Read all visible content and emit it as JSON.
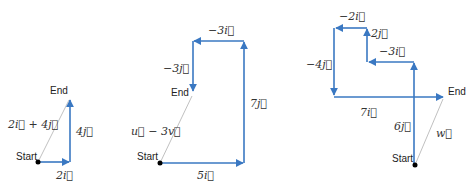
{
  "colors": {
    "vector": "#3a78c2",
    "resultant": "#b0b0b0",
    "point": "#000000",
    "text": "#222222"
  },
  "diagrams": [
    {
      "id": "diagram-1",
      "start_label": "Start",
      "end_label": "End",
      "resultant_label": "2i⃗ + 4j⃗",
      "steps": [
        {
          "label": "2i⃗",
          "dx": 2,
          "dy": 0
        },
        {
          "label": "4j⃗",
          "dx": 0,
          "dy": 4
        }
      ]
    },
    {
      "id": "diagram-2",
      "start_label": "Start",
      "end_label": "End",
      "resultant_label": "u⃗ − 3v⃗",
      "steps": [
        {
          "label": "5i⃗",
          "dx": 5,
          "dy": 0
        },
        {
          "label": "7j⃗",
          "dx": 0,
          "dy": 7
        },
        {
          "label": "−3i⃗",
          "dx": -3,
          "dy": 0
        },
        {
          "label": "−3j⃗",
          "dx": 0,
          "dy": -3
        }
      ]
    },
    {
      "id": "diagram-3",
      "start_label": "Start",
      "end_label": "End",
      "resultant_label": "w⃗",
      "steps": [
        {
          "label": "6j⃗",
          "dx": 0,
          "dy": 6
        },
        {
          "label": "−3i⃗",
          "dx": -3,
          "dy": 0
        },
        {
          "label": "2j⃗",
          "dx": 0,
          "dy": 2
        },
        {
          "label": "−2i⃗",
          "dx": -2,
          "dy": 0
        },
        {
          "label": "−4j⃗",
          "dx": 0,
          "dy": -4
        },
        {
          "label": "7i⃗",
          "dx": 7,
          "dy": 0
        }
      ]
    }
  ]
}
